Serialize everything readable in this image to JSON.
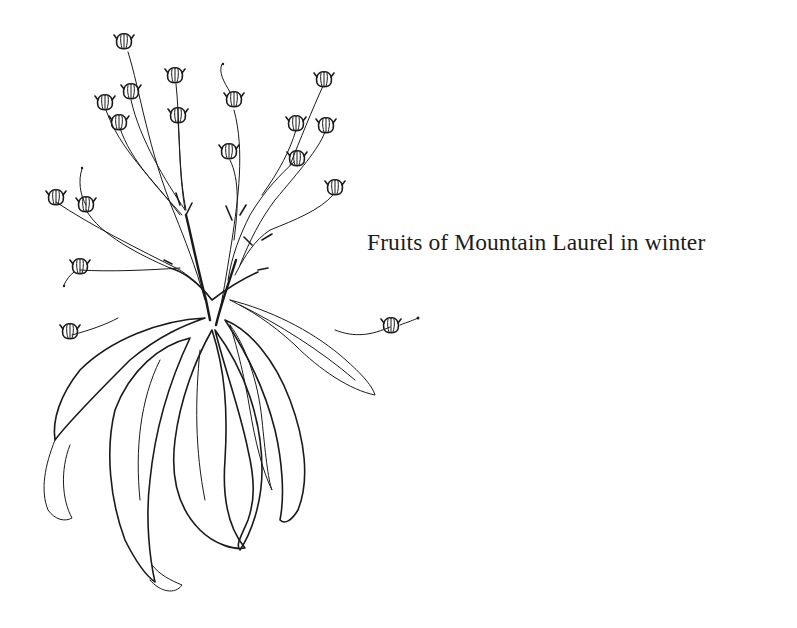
{
  "page": {
    "background": "#ffffff",
    "ink_color": "#1a1a1a"
  },
  "illustration": {
    "subject": "Mountain Laurel branch with dried fruit capsules and drooping winter leaves",
    "style": "pen-and-ink line drawing with hatching",
    "icon": "botanical-illustration"
  },
  "caption": {
    "text": "Fruits of Mountain Laurel in winter"
  }
}
